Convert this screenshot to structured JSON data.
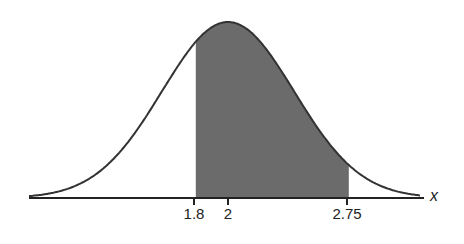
{
  "chart_data": {
    "type": "area",
    "title": "",
    "xlabel": "x",
    "ylabel": "",
    "distribution": "normal",
    "mean": 2,
    "sd": 0.41,
    "shaded_region": {
      "from": 1.8,
      "to": 2.75
    },
    "tick_labels": [
      "1.8",
      "2",
      "2.75"
    ],
    "ticks": [
      1.8,
      2,
      2.75
    ],
    "grid": false,
    "legend": null
  },
  "colors": {
    "shade": "#6b6b6b",
    "curve": "#333333",
    "axis": "#222222"
  }
}
